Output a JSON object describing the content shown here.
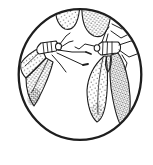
{
  "figure": {
    "title": "Pen-and-ink line drawing of whiteflies with stippled wings inside a circular vignette",
    "subject": "whiteflies",
    "full_insects_visible": 2,
    "partial_insects_visible": 1
  },
  "colors": {
    "ink": "#1e1e1e",
    "paper": "#ffffff"
  }
}
